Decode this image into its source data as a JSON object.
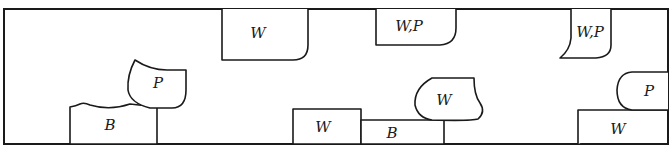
{
  "diagram": {
    "title": "",
    "frame": {
      "x": 4,
      "y": 9,
      "width": 664,
      "height": 135
    },
    "shapes": [
      {
        "id": "top-w-1",
        "label": "W",
        "anchor": "top-wall"
      },
      {
        "id": "top-wp-1",
        "label": "W,P",
        "anchor": "top-wall"
      },
      {
        "id": "top-wp-2",
        "label": "W,P",
        "anchor": "top-wall"
      },
      {
        "id": "bottom-b-1",
        "label": "B",
        "anchor": "bottom-wall"
      },
      {
        "id": "floating-p-1",
        "label": "P",
        "anchor": "on-B"
      },
      {
        "id": "bottom-w-1",
        "label": "W",
        "anchor": "bottom-wall"
      },
      {
        "id": "bottom-b-2",
        "label": "B",
        "anchor": "bottom-wall"
      },
      {
        "id": "floating-w-1",
        "label": "W",
        "anchor": "on-B"
      },
      {
        "id": "bottom-w-2",
        "label": "W",
        "anchor": "bottom-wall"
      },
      {
        "id": "right-p-1",
        "label": "P",
        "anchor": "right-wall"
      }
    ],
    "legend_colors": {
      "line": "#1a1a1a",
      "background": "#ffffff"
    }
  }
}
